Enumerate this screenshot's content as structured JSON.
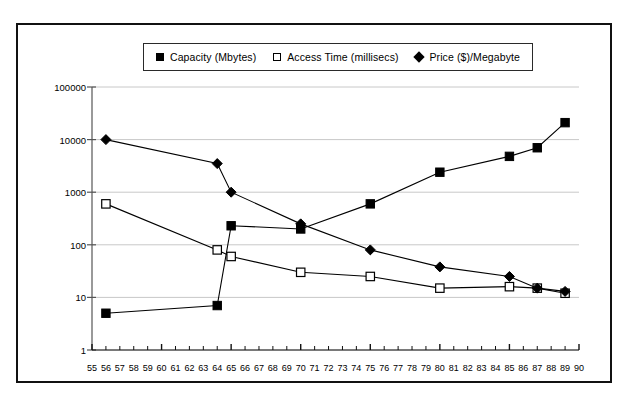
{
  "chart_data": {
    "type": "line",
    "title": "",
    "subtitle": "",
    "xlabel": "",
    "ylabel": "",
    "x": [
      55,
      56,
      57,
      58,
      59,
      60,
      61,
      62,
      63,
      64,
      65,
      66,
      67,
      68,
      69,
      70,
      71,
      72,
      73,
      74,
      75,
      76,
      77,
      78,
      79,
      80,
      81,
      82,
      83,
      84,
      85,
      86,
      87,
      88,
      89,
      90
    ],
    "xlim": [
      55,
      90
    ],
    "ylim": [
      1,
      100000
    ],
    "yscale": "log",
    "ytick_labels": [
      "100000",
      "10000",
      "1000",
      "100",
      "10",
      "1"
    ],
    "ytick_values": [
      100000,
      10000,
      1000,
      100,
      10,
      1
    ],
    "xtick_labels": [
      "55",
      "56",
      "57",
      "58",
      "59",
      "60",
      "61",
      "62",
      "63",
      "64",
      "65",
      "66",
      "67",
      "68",
      "69",
      "70",
      "71",
      "72",
      "73",
      "74",
      "75",
      "76",
      "77",
      "78",
      "79",
      "80",
      "81",
      "82",
      "83",
      "84",
      "85",
      "86",
      "87",
      "88",
      "89",
      "90"
    ],
    "grid": true,
    "grid_axis": "y",
    "legend_position": "top-center",
    "series": [
      {
        "name": "Capacity (Mbytes)",
        "marker": "filled-square",
        "color": "#000000",
        "points": [
          {
            "x": 56,
            "y": 5
          },
          {
            "x": 64,
            "y": 7
          },
          {
            "x": 65,
            "y": 230
          },
          {
            "x": 70,
            "y": 200
          },
          {
            "x": 75,
            "y": 600
          },
          {
            "x": 80,
            "y": 2400
          },
          {
            "x": 85,
            "y": 4800
          },
          {
            "x": 87,
            "y": 7000
          },
          {
            "x": 89,
            "y": 21000
          }
        ]
      },
      {
        "name": "Access Time (millisecs)",
        "marker": "open-square",
        "color": "#000000",
        "points": [
          {
            "x": 56,
            "y": 600
          },
          {
            "x": 64,
            "y": 80
          },
          {
            "x": 65,
            "y": 60
          },
          {
            "x": 70,
            "y": 30
          },
          {
            "x": 75,
            "y": 25
          },
          {
            "x": 80,
            "y": 15
          },
          {
            "x": 85,
            "y": 16
          },
          {
            "x": 87,
            "y": 15
          },
          {
            "x": 89,
            "y": 12
          }
        ]
      },
      {
        "name": "Price ($)/Megabyte",
        "marker": "filled-diamond",
        "color": "#000000",
        "points": [
          {
            "x": 56,
            "y": 10000
          },
          {
            "x": 64,
            "y": 3500
          },
          {
            "x": 65,
            "y": 1000
          },
          {
            "x": 70,
            "y": 250
          },
          {
            "x": 75,
            "y": 80
          },
          {
            "x": 80,
            "y": 38
          },
          {
            "x": 85,
            "y": 25
          },
          {
            "x": 87,
            "y": 15
          },
          {
            "x": 89,
            "y": 13
          }
        ]
      }
    ]
  },
  "legend": {
    "items": [
      {
        "label": "Capacity (Mbytes)",
        "marker": "filled-square"
      },
      {
        "label": "Access Time (millisecs)",
        "marker": "open-square"
      },
      {
        "label": "Price ($)/Megabyte",
        "marker": "filled-diamond"
      }
    ]
  },
  "colors": {
    "ink": "#000000",
    "grid": "#c8c8c8",
    "axis": "#555555",
    "frame": "#111111"
  }
}
